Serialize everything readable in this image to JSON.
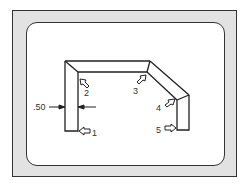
{
  "diagram": {
    "title": "",
    "dimension_label": ".50",
    "callouts": [
      {
        "id": "1",
        "label": "1"
      },
      {
        "id": "2",
        "label": "2"
      },
      {
        "id": "3",
        "label": "3"
      },
      {
        "id": "4",
        "label": "4"
      },
      {
        "id": "5",
        "label": "5"
      }
    ],
    "colors": {
      "frame_fill": "#e2e2e2",
      "panel_fill": "#ffffff",
      "line": "#222222"
    }
  }
}
